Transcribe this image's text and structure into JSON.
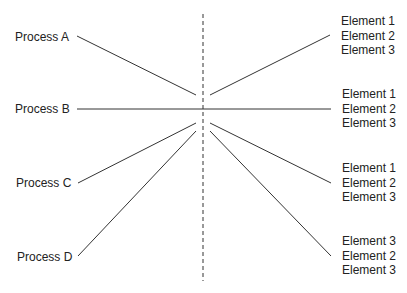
{
  "diagram": {
    "processes": [
      {
        "label": "Process A"
      },
      {
        "label": "Process B"
      },
      {
        "label": "Process C"
      },
      {
        "label": "Process D"
      }
    ],
    "element_groups": [
      {
        "items": [
          "Element 1",
          "Element 2",
          "Element 3"
        ]
      },
      {
        "items": [
          "Element 1",
          "Element 2",
          "Element 3"
        ]
      },
      {
        "items": [
          "Element 1",
          "Element 2",
          "Element 3"
        ]
      },
      {
        "items": [
          "Element 3",
          "Element 2",
          "Element 3"
        ]
      }
    ],
    "line_color": "#333333",
    "divider_style": "dashed"
  }
}
